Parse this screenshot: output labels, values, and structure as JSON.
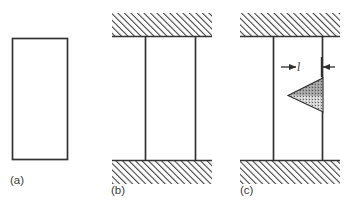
{
  "figure": {
    "kind": "technical-line-diagram",
    "background_color": "#ffffff",
    "line_color": "#333333",
    "hatch_color": "#3a3a3a",
    "stipple_color": "#2b2b2b",
    "panels": [
      {
        "id": "a",
        "label": "(a)",
        "description": "unstressed specimen outline",
        "specimen": {
          "x": 12,
          "y": 38,
          "width": 56,
          "height": 122
        },
        "grips": [],
        "crack": null
      },
      {
        "id": "b",
        "label": "(b)",
        "description": "specimen held between hatched grips under load",
        "specimen": {
          "x": 145,
          "y": 37,
          "width": 51,
          "height": 123
        },
        "grips": [
          {
            "name": "top-grip",
            "x": 112,
            "y": 13,
            "width": 100,
            "height": 24
          },
          {
            "name": "bottom-grip",
            "x": 112,
            "y": 160,
            "width": 100,
            "height": 24
          }
        ],
        "crack": null
      },
      {
        "id": "c",
        "label": "(c)",
        "description": "specimen with stippled triangular edge crack of length l",
        "specimen": {
          "x": 273,
          "y": 37,
          "width": 50,
          "height": 123
        },
        "grips": [
          {
            "name": "top-grip",
            "x": 240,
            "y": 13,
            "width": 100,
            "height": 24
          },
          {
            "name": "bottom-grip",
            "x": 240,
            "y": 160,
            "width": 100,
            "height": 24
          }
        ],
        "crack": {
          "shape": "triangle",
          "texture": "stipple",
          "apex": {
            "x": 288,
            "y": 95
          },
          "mouth_top": {
            "x": 323,
            "y": 78
          },
          "mouth_bottom": {
            "x": 323,
            "y": 112
          },
          "dimension": {
            "label": "l",
            "label_italic": true,
            "left_arrow": {
              "tail_x": 282,
              "head_x": 296,
              "y": 67
            },
            "right_arrow": {
              "tail_x": 334,
              "head_x": 322,
              "y": 67
            },
            "tick": {
              "x": 322,
              "y_top": 58,
              "y_bottom": 76
            }
          }
        }
      }
    ],
    "hatching": {
      "style": "diagonal",
      "direction": "lower-left-to-upper-right",
      "angle_deg": 45,
      "spacing_px": 3.2,
      "stroke_width_px": 1.6
    }
  }
}
